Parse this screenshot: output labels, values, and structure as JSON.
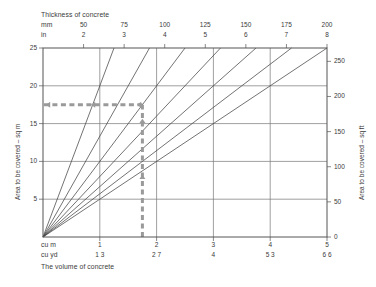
{
  "chart_data": {
    "type": "line",
    "title": "Thickness of concrete",
    "subtitle": "The volume of concrete",
    "xlabel": "The volume of concrete",
    "ylabel": "Area to be covered – sq m",
    "ylabel_secondary": "Area to be covered – sq ft",
    "grid": true,
    "legend_position": "none",
    "x_axis": {
      "name": "cu m",
      "unit": "cu m",
      "ticks": [
        1,
        2,
        3,
        4,
        5
      ],
      "tick_labels": [
        "1",
        "2",
        "3",
        "4",
        "5"
      ],
      "xlim": [
        0,
        5
      ]
    },
    "x_axis_secondary": {
      "name": "cu yd",
      "unit": "cu yd",
      "ticks": [
        1.3,
        2.7,
        4,
        5.3,
        6.6
      ],
      "tick_labels": [
        "1 3",
        "2 7",
        "4",
        "5 3",
        "6 6"
      ]
    },
    "y_axis": {
      "name": "Area to be covered – sq m",
      "unit": "sq m",
      "ticks": [
        5,
        10,
        15,
        20,
        25
      ],
      "tick_labels": [
        "5",
        "10",
        "15",
        "20",
        "25"
      ],
      "ylim": [
        0,
        25
      ]
    },
    "y_axis_secondary": {
      "name": "Area to be covered – sq ft",
      "unit": "sq ft",
      "ticks": [
        0,
        50,
        100,
        150,
        200,
        250
      ],
      "tick_labels": [
        "0",
        "50",
        "100",
        "150",
        "200",
        "250"
      ],
      "ylim": [
        0,
        269
      ]
    },
    "top_axis": {
      "name": "Thickness of concrete",
      "unit_primary": "mm",
      "unit_secondary": "in",
      "ticks_mm": [
        50,
        75,
        100,
        125,
        150,
        175,
        200
      ],
      "tick_labels_mm": [
        "50",
        "75",
        "100",
        "125",
        "150",
        "175",
        "200"
      ],
      "ticks_in": [
        2,
        3,
        4,
        5,
        6,
        7,
        8
      ],
      "tick_labels_in": [
        "2",
        "3",
        "4",
        "5",
        "6",
        "7",
        "8"
      ]
    },
    "series": [
      {
        "name": "50 mm",
        "thickness_mm": 50,
        "thickness_in": 2,
        "x": [
          0,
          1.25
        ],
        "y": [
          0,
          25
        ]
      },
      {
        "name": "75 mm",
        "thickness_mm": 75,
        "thickness_in": 3,
        "x": [
          0,
          1.875
        ],
        "y": [
          0,
          25
        ]
      },
      {
        "name": "100 mm",
        "thickness_mm": 100,
        "thickness_in": 4,
        "x": [
          0,
          2.5
        ],
        "y": [
          0,
          25
        ]
      },
      {
        "name": "125 mm",
        "thickness_mm": 125,
        "thickness_in": 5,
        "x": [
          0,
          3.125
        ],
        "y": [
          0,
          25
        ]
      },
      {
        "name": "150 mm",
        "thickness_mm": 150,
        "thickness_in": 6,
        "x": [
          0,
          3.75
        ],
        "y": [
          0,
          25
        ]
      },
      {
        "name": "175 mm",
        "thickness_mm": 175,
        "thickness_in": 7,
        "x": [
          0,
          4.375
        ],
        "y": [
          0,
          25
        ]
      },
      {
        "name": "200 mm",
        "thickness_mm": 200,
        "thickness_in": 8,
        "x": [
          0,
          5.0
        ],
        "y": [
          0,
          25
        ]
      }
    ],
    "annotations": [
      {
        "name": "worked-example-guide",
        "style": "dashed-arrow",
        "color": "#9a9a9a",
        "volume_cu_m": 1.75,
        "area_sq_m": 17.5,
        "thickness_mm": 50,
        "path": "vertical from x=1.75 on bottom axis up to the 50 mm line at y=17.5 sq m, then horizontal left to the sq m axis"
      }
    ],
    "colors": {
      "frame": "#555555",
      "grid": "#777777",
      "line": "#444444",
      "guide": "#9a9a9a",
      "text": "#3a3a3a",
      "background": "#ffffff"
    }
  },
  "header": {
    "title": "Thickness of concrete",
    "unit_mm": "mm",
    "unit_in": "in"
  },
  "footer": {
    "unit_cum": "cu m",
    "unit_cuyd": "cu yd",
    "title": "The volume of concrete"
  },
  "axis_titles": {
    "left": "Area to be covered – sq m",
    "right": "Area to be covered – sq ft"
  }
}
